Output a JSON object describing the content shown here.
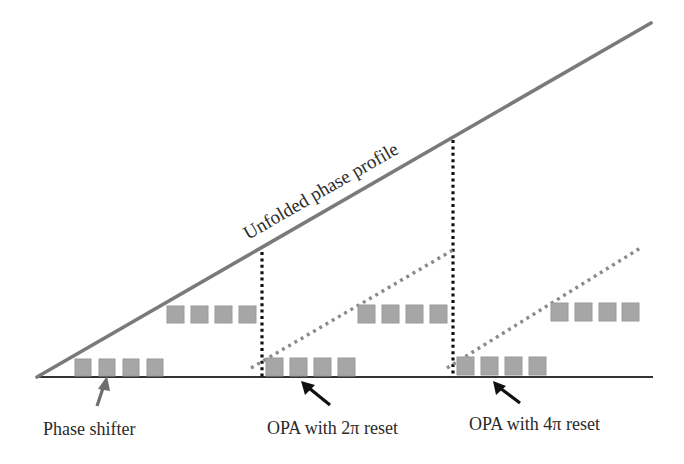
{
  "diagram": {
    "title_label": "Unfolded phase profile",
    "labels": {
      "phase_shifter": "Phase shifter",
      "opa_2pi": "OPA with 2π reset",
      "opa_4pi": "OPA with 4π reset"
    },
    "colors": {
      "profile_line": "#7a7a7a",
      "baseline": "#333333",
      "reset_marker": "#111111",
      "wrapped_profile": "#8a8a8a",
      "phase_shifter_fill": "#a6a6a6",
      "phase_shifter_stroke": "#999999",
      "arrow_gray": "#6e6e6e",
      "arrow_black": "#111111",
      "text": "#2a2a2a"
    },
    "groups": [
      {
        "name": "phase-shifter-group",
        "lower_x": [
          75,
          99,
          123,
          147
        ],
        "upper_x": [
          167,
          191,
          215,
          239
        ]
      },
      {
        "name": "opa-2pi-group",
        "lower_x": [
          266,
          290,
          314,
          338
        ],
        "upper_x": [
          358,
          382,
          406,
          430
        ]
      },
      {
        "name": "opa-4pi-group",
        "lower_x": [
          457,
          481,
          505,
          529
        ],
        "upper_x": [
          551,
          575,
          599,
          622
        ]
      }
    ]
  }
}
